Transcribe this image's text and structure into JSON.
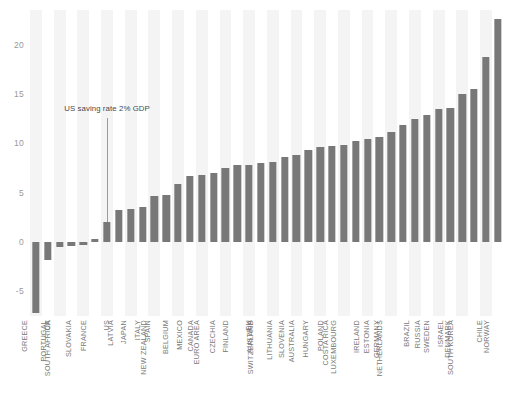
{
  "chart_data": {
    "type": "bar",
    "title": "",
    "xlabel": "",
    "ylabel": "",
    "ylim": [
      -7.5,
      23.5
    ],
    "yticks": [
      -5,
      0,
      5,
      10,
      15,
      20
    ],
    "ytick_labels": [
      "-5",
      "0",
      "5",
      "10",
      "15",
      "20"
    ],
    "grid": false,
    "legend": "none",
    "bar_color": "#787878",
    "stripe_color": "#f4f4f4",
    "categories": [
      "GREECE",
      "UK",
      "PORTUGAL",
      "SOUTH AFRICA",
      "SLOVAKIA",
      "FRANCE",
      "US",
      "LATVIA",
      "JAPAN",
      "ITALY",
      "SPAIN",
      "NEW ZEALAND",
      "BELGIUM",
      "MEXICO",
      "CANADA",
      "EURO AREA",
      "CZECHIA",
      "FINLAND",
      "EU",
      "AUSTRIA",
      "SWITZERLAND",
      "LITHUANIA",
      "SLOVENIA",
      "AUSTRALIA",
      "HUNGARY",
      "POLAND",
      "COSTA RICA",
      "LUXEMBOURG",
      "IRELAND",
      "ESTONIA",
      "GERMANY",
      "NETHERLANDS",
      "BRAZIL",
      "RUSSIA",
      "SWEDEN",
      "ISRAEL",
      "DENMARK",
      "SOUTH KOREA",
      "CHILE",
      "NORWAY"
    ],
    "values": [
      -7.2,
      -1.8,
      -0.5,
      -0.4,
      -0.3,
      0.3,
      2.0,
      3.2,
      3.3,
      3.5,
      4.7,
      4.8,
      5.9,
      6.7,
      6.8,
      7.0,
      7.5,
      7.8,
      7.8,
      8.0,
      8.1,
      8.6,
      8.8,
      9.3,
      9.6,
      9.7,
      9.8,
      10.2,
      10.4,
      10.6,
      11.1,
      11.8,
      12.5,
      12.9,
      13.5,
      13.6,
      15.0,
      15.5,
      18.7,
      22.6
    ],
    "annotations": [
      {
        "text": "US saving rate 2% GDP",
        "target_category": "US",
        "target_value": 2.0
      }
    ]
  }
}
